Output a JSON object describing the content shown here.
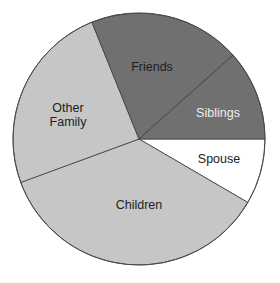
{
  "chart_data": {
    "type": "pie",
    "title": "",
    "center": [
      139,
      139
    ],
    "radius": 126,
    "start_angle_deg": 0,
    "direction": "clockwise",
    "slices": [
      {
        "label": "Spouse",
        "lines": [
          "Spouse"
        ],
        "value": 8.4,
        "color": "#ffffff",
        "text_color": "#222222",
        "label_pos": [
          219,
          160
        ]
      },
      {
        "label": "Children",
        "lines": [
          "Children"
        ],
        "value": 36.0,
        "color": "#c6c6c6",
        "text_color": "#222222",
        "label_pos": [
          139,
          206
        ]
      },
      {
        "label": "Other Family",
        "lines": [
          "Other",
          "Family"
        ],
        "value": 24.5,
        "color": "#c6c6c6",
        "text_color": "#222222",
        "label_pos": [
          68,
          116
        ]
      },
      {
        "label": "Friends",
        "lines": [
          "Friends"
        ],
        "value": 19.5,
        "color": "#707070",
        "text_color": "#1e1e1e",
        "label_pos": [
          152,
          68
        ]
      },
      {
        "label": "Siblings",
        "lines": [
          "Siblings"
        ],
        "value": 11.6,
        "color": "#707070",
        "text_color": "#eeeeee",
        "label_pos": [
          218,
          114
        ]
      }
    ],
    "categories": [
      "Spouse",
      "Children",
      "Other Family",
      "Friends",
      "Siblings"
    ],
    "values": [
      8.4,
      36.0,
      24.5,
      19.5,
      11.6
    ],
    "unit": "percent (estimated from slice angles)",
    "legend": "none (labels inside slices)"
  }
}
